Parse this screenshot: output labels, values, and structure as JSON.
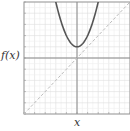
{
  "chart_data": {
    "type": "line",
    "title": "",
    "xlabel": "x",
    "ylabel": "f(x)",
    "xlim": [
      -5,
      5
    ],
    "ylim": [
      -5,
      5
    ],
    "grid": true,
    "legend": null,
    "series": [
      {
        "name": "f(x) = x^2 + 1 (parabola)",
        "style": "solid",
        "color": "#555555",
        "x": [
          -2.2,
          -2,
          -1.5,
          -1,
          -0.5,
          0,
          0.5,
          1,
          1.5,
          2,
          2.2
        ],
        "y": [
          5.84,
          5,
          3.25,
          2,
          1.25,
          1,
          1.25,
          2,
          3.25,
          5,
          5.84
        ]
      },
      {
        "name": "y = x (identity)",
        "style": "dashed",
        "color": "#bbbbbb",
        "x": [
          -5,
          5
        ],
        "y": [
          -5,
          5
        ]
      }
    ]
  },
  "labels": {
    "x_axis": "x",
    "y_axis": "f(x)"
  },
  "colors": {
    "grid_minor": "#eeeeee",
    "grid_major": "#dddddd",
    "frame": "#999999",
    "axis": "#888888"
  }
}
